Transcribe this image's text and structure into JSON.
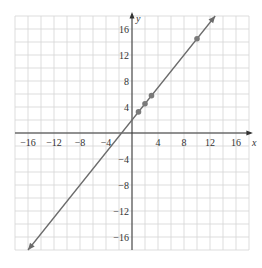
{
  "chart_data": {
    "type": "line",
    "title": "",
    "xlabel": "x",
    "ylabel": "y",
    "xlim": [
      -18,
      18
    ],
    "ylim": [
      -18,
      18
    ],
    "grid": true,
    "x_ticks": [
      -16,
      -12,
      -8,
      -4,
      4,
      8,
      12,
      16
    ],
    "y_ticks": [
      16,
      12,
      8,
      4,
      -4,
      -8,
      -12,
      -16
    ],
    "series": [
      {
        "name": "line",
        "equation": "y = 1.25x + 2",
        "x": [
          -16,
          12.8
        ],
        "y": [
          -18,
          18
        ]
      }
    ],
    "points": [
      {
        "x": 1,
        "y": 3.25
      },
      {
        "x": 2,
        "y": 4.5
      },
      {
        "x": 3,
        "y": 5.75
      },
      {
        "x": 10,
        "y": 14.5
      }
    ],
    "line_color": "#6b6b6b",
    "point_color": "#7a7a7a"
  }
}
